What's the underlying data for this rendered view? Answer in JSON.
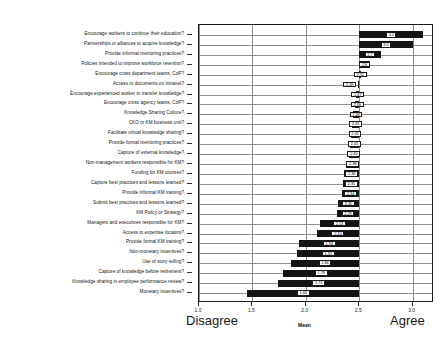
{
  "chart_data": {
    "type": "bar",
    "orientation": "horizontal",
    "title": "",
    "subtitle": "",
    "xlabel": "Mean",
    "ylabel": "",
    "xlim": [
      1.0,
      3.2
    ],
    "xticks": [
      1.0,
      1.5,
      2.0,
      2.5,
      3.0
    ],
    "xticklabels": [
      "1.0",
      "1.5",
      "2.0",
      "2.5",
      "3.0"
    ],
    "grid": true,
    "legend": null,
    "anchor_low": "Disagree",
    "anchor_high": "Agree",
    "baseline": 2.5,
    "note": "Floating deviation bars drawn from a common baseline of 2.5; each bar is labelled with its mean value.",
    "categories": [
      "Encourage workers to continue their education?",
      "Partnerships or alliances to acquire knowledge?",
      "Provide informal mentoring practices?",
      "Policies intended to improve workforce retention?",
      "Encourage cross department teams, CoP?",
      "Access to documents on Intranet?",
      "Encourage experienced worker to transfer knowledge?",
      "Encourage cross agency teams, CoP?",
      "Knowledge Sharing Culture?",
      "CKO or KM business unit?",
      "Facilitate virtual knowledge sharing?",
      "Provide formal mentoring practices?",
      "Capture of external knowledge?",
      "Non-management workers responsible for KM?",
      "Funding for KM courses?",
      "Capture best practices and lessons learned?",
      "Provide informal KM training?",
      "Submit best practices and lessons learned?",
      "KM Policy or Strategy?",
      "Managers and executives responsible for KM?",
      "Access to expertise locators?",
      "Provide formal KM training?",
      "Non-monetary incentives?",
      "Use of story-telling?",
      "Capture of knowledge before retirement?",
      "Knowledge sharing in employee performance review?",
      "Monetary incentives?"
    ],
    "values": [
      3.1,
      3.0,
      2.7,
      2.6,
      2.52,
      2.49,
      2.47,
      2.46,
      2.44,
      2.43,
      2.42,
      2.41,
      2.4,
      2.38,
      2.36,
      2.35,
      2.34,
      2.3,
      2.29,
      2.13,
      2.1,
      1.94,
      1.92,
      1.86,
      1.79,
      1.74,
      1.45
    ],
    "value_labels": [
      "3.1",
      "3.0",
      "2.7",
      "2.6",
      "2.52",
      "2.49",
      "2.47",
      "2.46",
      "2.44",
      "2.43",
      "2.42",
      "2.41",
      "2.40",
      "2.38",
      "2.36",
      "2.35",
      "2.34",
      "2.30",
      "2.29",
      "2.13",
      "2.10",
      "1.94",
      "1.92",
      "1.86",
      "1.79",
      "1.74",
      "1.45"
    ]
  }
}
